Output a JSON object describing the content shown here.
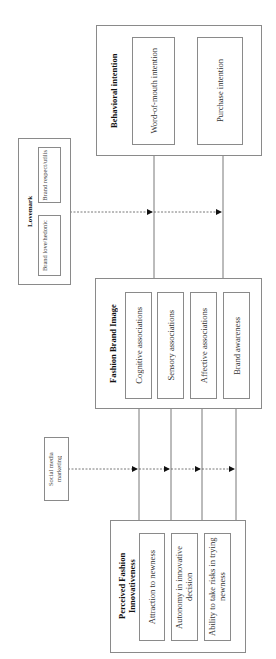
{
  "behavioral_intention": {
    "title": "Behavioral intention",
    "items": [
      {
        "label": "Word-of-mouth intention"
      },
      {
        "label": "Purchase intention"
      }
    ]
  },
  "lovemark": {
    "title": "Lovemark",
    "items": [
      {
        "label": "Brand respect/utilis"
      },
      {
        "label": "Brand love/hedonic"
      }
    ]
  },
  "fashion_brand_image": {
    "title": "Fashion Brand Image",
    "items": [
      {
        "label": "Cognitive associations"
      },
      {
        "label": "Sensory associations"
      },
      {
        "label": "Affective associations"
      },
      {
        "label": "Brand awareness"
      }
    ]
  },
  "social_media": {
    "label": "Social media marketing"
  },
  "perceived_innovativeness": {
    "title": "Perceived Fashion Innovativeness",
    "items": [
      {
        "label": "Attraction to newness"
      },
      {
        "label": "Autonomy in innovative decision"
      },
      {
        "label": "Ability to take risks in trying newness"
      }
    ]
  },
  "colors": {
    "line": "#555555",
    "border": "#8a8a8a",
    "background": "#ffffff"
  }
}
